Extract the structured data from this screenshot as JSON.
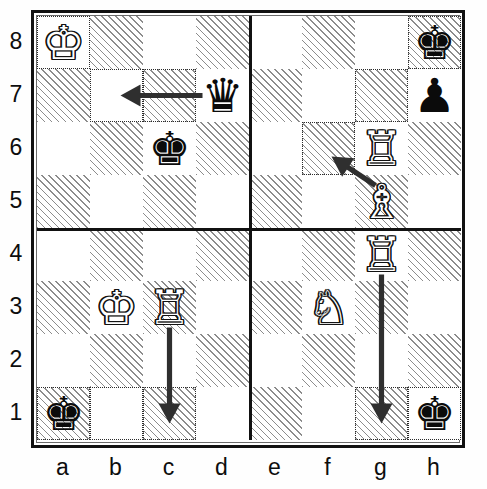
{
  "diagram": {
    "type": "chess-board-diagram",
    "board_size": 8,
    "quadrant_dividers": {
      "vertical_between_files": "d|e",
      "horizontal_between_ranks": "4|5"
    }
  },
  "coordinates": {
    "files": [
      "a",
      "b",
      "c",
      "d",
      "e",
      "f",
      "g",
      "h"
    ],
    "ranks": [
      "8",
      "7",
      "6",
      "5",
      "4",
      "3",
      "2",
      "1"
    ]
  },
  "colors": {
    "light_square": "#ffffff",
    "dark_square_hatch": "#8c8c8c",
    "border": "#111111",
    "highlight_outline": "#2b2b2b",
    "arrow": "#2f2f2f",
    "white_piece_fill": "#ffffff",
    "black_piece_fill": "#0b0b0b"
  },
  "pieces": [
    {
      "id": "wk-a8",
      "square": "a8",
      "file": 0,
      "rank": 0,
      "color": "white",
      "type": "king",
      "glyph": "♔",
      "name": "white-king"
    },
    {
      "id": "bk-h8",
      "square": "h8",
      "file": 7,
      "rank": 0,
      "color": "black",
      "type": "king",
      "glyph": "♚",
      "name": "black-king"
    },
    {
      "id": "bq-d7",
      "square": "d7",
      "file": 3,
      "rank": 1,
      "color": "black",
      "type": "queen",
      "glyph": "♛",
      "name": "black-queen"
    },
    {
      "id": "bp-h7",
      "square": "h7",
      "file": 7,
      "rank": 1,
      "color": "black",
      "type": "pawn",
      "glyph": "♟",
      "name": "black-pawn"
    },
    {
      "id": "bk-c6",
      "square": "c6",
      "file": 2,
      "rank": 2,
      "color": "black",
      "type": "king",
      "glyph": "♚",
      "name": "black-king"
    },
    {
      "id": "wr-g6",
      "square": "g6",
      "file": 6,
      "rank": 2,
      "color": "white",
      "type": "rook",
      "glyph": "♖",
      "name": "white-rook"
    },
    {
      "id": "wb-g5",
      "square": "g5",
      "file": 6,
      "rank": 3,
      "color": "white",
      "type": "bishop",
      "glyph": "♗",
      "name": "white-bishop"
    },
    {
      "id": "wr-g4",
      "square": "g4",
      "file": 6,
      "rank": 4,
      "color": "white",
      "type": "rook",
      "glyph": "♖",
      "name": "white-rook"
    },
    {
      "id": "wk-b3",
      "square": "b3",
      "file": 1,
      "rank": 5,
      "color": "white",
      "type": "king",
      "glyph": "♔",
      "name": "white-king"
    },
    {
      "id": "wr-c3",
      "square": "c3",
      "file": 2,
      "rank": 5,
      "color": "white",
      "type": "rook",
      "glyph": "♖",
      "name": "white-rook"
    },
    {
      "id": "wn-f3",
      "square": "f3",
      "file": 5,
      "rank": 5,
      "color": "white",
      "type": "knight",
      "glyph": "♘",
      "name": "white-knight"
    },
    {
      "id": "bk-a1",
      "square": "a1",
      "file": 0,
      "rank": 7,
      "color": "black",
      "type": "king",
      "glyph": "♚",
      "name": "black-king"
    },
    {
      "id": "bk-h1",
      "square": "h1",
      "file": 7,
      "rank": 7,
      "color": "black",
      "type": "king",
      "glyph": "♚",
      "name": "black-king"
    }
  ],
  "arrows": [
    {
      "id": "arrow-d7-b7",
      "from": "d7",
      "to": "b7",
      "direction": "left",
      "name": "move-arrow-queen-d7-b7"
    },
    {
      "id": "arrow-g5-f6",
      "from": "g5",
      "to": "f6",
      "direction": "diagonal-up-left",
      "name": "move-arrow-bishop-g5-f6"
    },
    {
      "id": "arrow-c3-c1",
      "from": "c3",
      "to": "c1",
      "direction": "down",
      "name": "move-arrow-rook-c3-c1"
    },
    {
      "id": "arrow-g4-g1",
      "from": "g4",
      "to": "g1",
      "direction": "down",
      "name": "move-arrow-rook-g4-g1"
    }
  ],
  "highlighted_squares": [
    "a8",
    "b7",
    "c7",
    "g7",
    "h8",
    "f6",
    "a1",
    "b1",
    "c1",
    "g1",
    "h1"
  ]
}
